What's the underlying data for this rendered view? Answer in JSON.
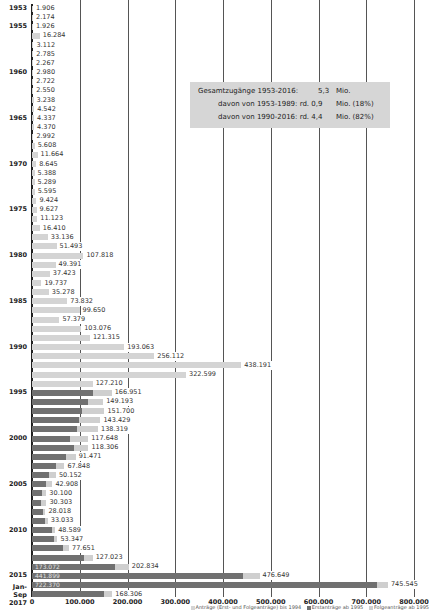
{
  "chart_data": {
    "type": "bar",
    "orientation": "horizontal",
    "stacked": true,
    "title": "",
    "xlabel": "",
    "ylabel": "",
    "xlim": [
      0,
      800000
    ],
    "x_ticks": [
      "0",
      "100.000",
      "200.000",
      "300.000",
      "400.000",
      "500.000",
      "600.000",
      "700.000",
      "800.000"
    ],
    "grid": "vertical",
    "legend": [
      {
        "label": "Anträge (Erst- und Folgeanträge) bis 1994",
        "color": "#d4d4d4"
      },
      {
        "label": "Erstanträge ab 1995",
        "color": "#707070"
      },
      {
        "label": "Folgeanträge ab 1995",
        "color": "#cfcfcf"
      }
    ],
    "legend_position": "bottom-right",
    "categories": [
      "1953",
      "1954",
      "1955",
      "1956",
      "1957",
      "1958",
      "1959",
      "1960",
      "1961",
      "1962",
      "1963",
      "1964",
      "1965",
      "1966",
      "1967",
      "1968",
      "1969",
      "1970",
      "1971",
      "1972",
      "1973",
      "1974",
      "1975",
      "1976",
      "1977",
      "1978",
      "1979",
      "1980",
      "1981",
      "1982",
      "1983",
      "1984",
      "1985",
      "1986",
      "1987",
      "1988",
      "1989",
      "1990",
      "1991",
      "1992",
      "1993",
      "1994",
      "1995",
      "1996",
      "1997",
      "1998",
      "1999",
      "2000",
      "2001",
      "2002",
      "2003",
      "2004",
      "2005",
      "2006",
      "2007",
      "2008",
      "2009",
      "2010",
      "2011",
      "2012",
      "2013",
      "2014",
      "2015",
      "2016",
      "Jan-Sep 2017"
    ],
    "year_labels": {
      "1953": "1953",
      "1955": "1955",
      "1960": "1960",
      "1965": "1965",
      "1970": "1970",
      "1975": "1975",
      "1980": "1980",
      "1985": "1985",
      "1990": "1990",
      "1995": "1995",
      "2000": "2000",
      "2005": "2005",
      "2010": "2010",
      "2015": "2015",
      "Jan-Sep 2017": "Jan-Sep 2017"
    },
    "totals": [
      1906,
      2174,
      1926,
      16284,
      3112,
      2785,
      2267,
      2980,
      2722,
      2550,
      3238,
      4542,
      4337,
      4370,
      2992,
      5608,
      11664,
      8645,
      5388,
      5289,
      5595,
      9424,
      9627,
      11123,
      16410,
      33136,
      51493,
      107818,
      49391,
      37423,
      19737,
      35278,
      73832,
      99650,
      57379,
      103076,
      121315,
      193063,
      256112,
      438191,
      322599,
      127210,
      166951,
      149193,
      151700,
      143429,
      138319,
      117648,
      118306,
      91471,
      67848,
      50152,
      42908,
      30100,
      30303,
      28018,
      33033,
      48589,
      53347,
      77651,
      127023,
      202834,
      476649,
      745545,
      168306
    ],
    "total_labels": [
      "1.906",
      "2.174",
      "1.926",
      "16.284",
      "3.112",
      "2.785",
      "2.267",
      "2.980",
      "2.722",
      "2.550",
      "3.238",
      "4.542",
      "4.337",
      "4.370",
      "2.992",
      "5.608",
      "11.664",
      "8.645",
      "5.388",
      "5.289",
      "5.595",
      "9.424",
      "9.627",
      "11.123",
      "16.410",
      "33.136",
      "51.493",
      "107.818",
      "49.391",
      "37.423",
      "19.737",
      "35.278",
      "73.832",
      "99.650",
      "57.379",
      "103.076",
      "121.315",
      "193.063",
      "256.112",
      "438.191",
      "322.599",
      "127.210",
      "166.951",
      "149.193",
      "151.700",
      "143.429",
      "138.319",
      "117.648",
      "118.306",
      "91.471",
      "67.848",
      "50.152",
      "42.908",
      "30.100",
      "30.303",
      "28.018",
      "33.033",
      "48.589",
      "53.347",
      "77.651",
      "127.023",
      "202.834",
      "476.649",
      "745.545",
      "168.306"
    ],
    "first_applications_from_1995": [
      127937,
      116367,
      104353,
      98644,
      95113,
      78564,
      88287,
      71127,
      50563,
      35607,
      28914,
      21029,
      19164,
      22085,
      27649,
      41332,
      45741,
      64539,
      109580,
      173072,
      441899,
      722370,
      151516
    ],
    "inner_labels": {
      "2014": "173.072",
      "2015": "441.899",
      "2016": "722.370"
    },
    "annotation": {
      "line1_label": "Gesamtzugänge 1953-2016:",
      "line1_value": "5,3",
      "line1_unit": "Mio.",
      "line2_label": "davon von 1953-1989: rd. 0,9",
      "line2_unit": "Mio. (18%)",
      "line3_label": "davon von 1990-2016: rd. 4,4",
      "line3_unit": "Mio. (82%)"
    }
  }
}
